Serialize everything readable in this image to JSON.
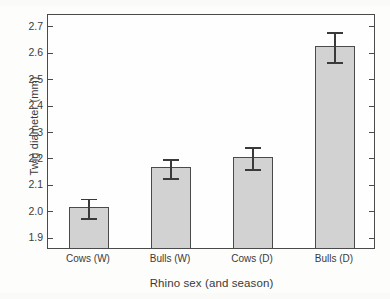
{
  "chart_data": {
    "type": "bar",
    "title": "",
    "xlabel": "Rhino sex (and season)",
    "ylabel": "Twig diameter (mm)",
    "categories": [
      "Cows (W)",
      "Bulls (W)",
      "Cows (D)",
      "Bulls (D)"
    ],
    "values": [
      2.01,
      2.16,
      2.2,
      2.62
    ],
    "errors": [
      0.04,
      0.04,
      0.045,
      0.06
    ],
    "error_upper": [
      2.05,
      2.2,
      2.245,
      2.68
    ],
    "error_lower": [
      1.97,
      2.12,
      2.155,
      2.56
    ],
    "ylim": [
      1.855,
      2.745
    ],
    "yticks": [
      1.9,
      2.0,
      2.1,
      2.2,
      2.3,
      2.4,
      2.5,
      2.6,
      2.7
    ],
    "ytick_labels": [
      "1.9",
      "2.0",
      "2.1",
      "2.2",
      "2.3",
      "2.4",
      "2.5",
      "2.6",
      "2.7"
    ],
    "grid": false,
    "legend": null,
    "bar_fill_color": "#d2d2d2",
    "bar_edge_color": "#4a4a4a",
    "error_bar_color": "#3a3a3a",
    "background_color": "#fdfdfb"
  }
}
